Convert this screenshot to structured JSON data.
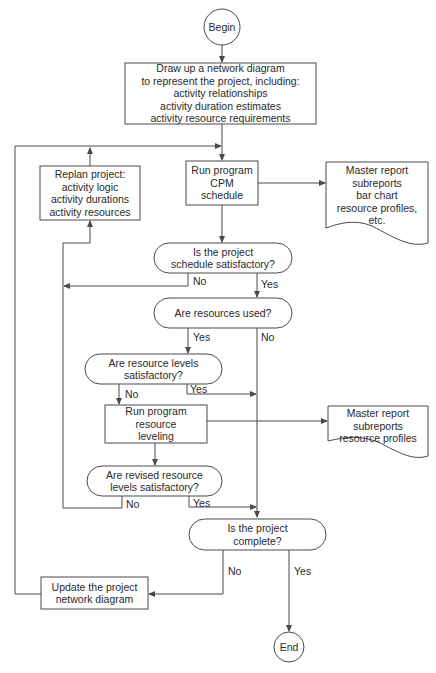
{
  "flowchart": {
    "begin": {
      "label": "Begin"
    },
    "draw_network": {
      "lines": [
        "Draw up a network diagram",
        "to represent the project, including:",
        "activity relationships",
        "activity duration estimates",
        "activity resource requirements"
      ]
    },
    "replan": {
      "lines": [
        "Replan project:",
        "activity logic",
        "activity durations",
        "activity resources"
      ]
    },
    "run_cpm": {
      "lines": [
        "Run program",
        "CPM",
        "schedule"
      ]
    },
    "report_cpm": {
      "lines": [
        "Master report",
        "subreports",
        "bar chart",
        "resource profiles,",
        "etc."
      ]
    },
    "decision_schedule": {
      "lines": [
        "Is the project",
        "schedule satisfactory?"
      ],
      "no": "No",
      "yes": "Yes"
    },
    "decision_resources_used": {
      "lines": [
        "Are resources used?"
      ],
      "yes": "Yes",
      "no": "No"
    },
    "decision_resource_levels": {
      "lines": [
        "Are resource levels",
        "satisfactory?"
      ],
      "no": "No",
      "yes": "Yes"
    },
    "run_leveling": {
      "lines": [
        "Run program",
        "resource",
        "leveling"
      ]
    },
    "report_leveling": {
      "lines": [
        "Master report",
        "subreports",
        "resource profiles"
      ]
    },
    "decision_revised_levels": {
      "lines": [
        "Are revised resource",
        "levels satisfactory?"
      ],
      "no": "No",
      "yes": "Yes"
    },
    "decision_complete": {
      "lines": [
        "Is the project",
        "complete?"
      ],
      "no": "No",
      "yes": "Yes"
    },
    "update_network": {
      "lines": [
        "Update the project",
        "network diagram"
      ]
    },
    "end": {
      "label": "End"
    }
  },
  "colors": {
    "stroke": "#4a4a4a",
    "text": "#2a2a2a",
    "background": "#ffffff"
  }
}
